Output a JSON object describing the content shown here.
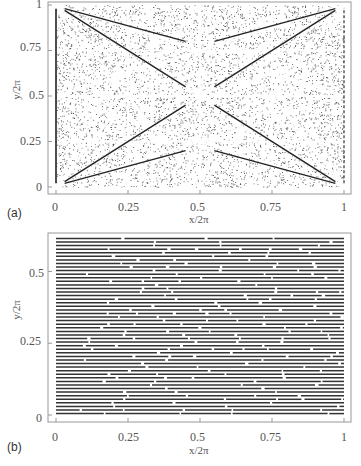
{
  "chart_data": [
    {
      "panel": "(a)",
      "type": "scatter",
      "title": "",
      "xlabel": "x/2π",
      "ylabel": "y/2π",
      "xlim": [
        0,
        1
      ],
      "ylim": [
        0,
        1
      ],
      "xticks": [
        "0",
        "0.25",
        "0.5",
        "0.75",
        "1"
      ],
      "yticks": [
        "0",
        "0.25",
        "0.5",
        "0.75",
        "1"
      ],
      "grid": false,
      "description": "Dense dot pattern with bright resonance lines (diagonals through center, verticals at x=0.25,0.5,0.75, symmetric star patterns)"
    },
    {
      "panel": "(b)",
      "type": "scatter",
      "title": "",
      "xlabel": "x/2π",
      "ylabel": "y/2π",
      "xlim": [
        0,
        1
      ],
      "ylim": [
        0,
        0.62
      ],
      "xticks": [
        "0",
        "0.25",
        "0.5",
        "0.75",
        "1"
      ],
      "yticks": [
        "0",
        "0.25",
        "0.5"
      ],
      "grid": false,
      "description": "Approximately 50 nearly horizontal dashed lines spanning full x range"
    }
  ],
  "panels": {
    "a": {
      "label": "(a)",
      "xlabel": "x/2π",
      "ylabel": "y/2π",
      "xticks": [
        "0",
        "0.25",
        "0.5",
        "0.75",
        "1"
      ],
      "yticks": [
        "0",
        "0.25",
        "0.5",
        "0.75",
        "1"
      ]
    },
    "b": {
      "label": "(b)",
      "xlabel": "x/2π",
      "ylabel": "y/2π",
      "xticks": [
        "0",
        "0.25",
        "0.5",
        "0.75",
        "1"
      ],
      "yticks": [
        "0",
        "0.25",
        "0.5"
      ]
    }
  },
  "colors": {
    "dots": "#333333",
    "frame": "#999999",
    "text": "#555555"
  }
}
